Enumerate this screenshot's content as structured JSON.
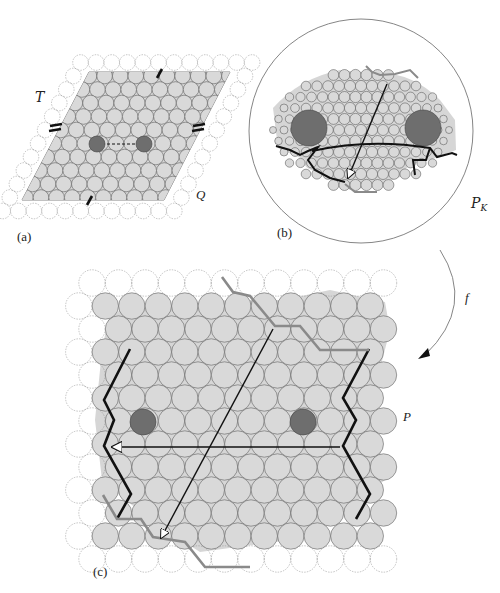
{
  "figure": {
    "panels": {
      "a": {
        "caption": "(a)",
        "label_torus": "T",
        "label_quad": "Q",
        "description": "Triangular circle packing on a parallelogram fundamental domain with two dark marked circles joined by a dashed segment; edge-identification tick marks on each side"
      },
      "b": {
        "caption": "(b)",
        "label_packing": "P",
        "label_packing_sub": "K",
        "description": "Circle packing inside a large bounding circle with two large dark circles, a curved black boundary path, a grey boundary path and an arrowed diagonal"
      },
      "c": {
        "caption": "(c)",
        "label_packing": "P",
        "description": "Regular hexagonal circle packing with two dark circles, black zig-zag side boundaries, grey stepped top/bottom boundaries, a horizontal arrow and a diagonal arrow"
      }
    },
    "map_label": "f",
    "colors": {
      "region_fill": "#d6d6d6",
      "circle_fill": "#d9d9d9",
      "circle_stroke": "#555555",
      "dark_circle": "#6e6e6e",
      "black_path": "#111111",
      "grey_path": "#8a8a8a",
      "dashed_circle": "#888888"
    }
  }
}
